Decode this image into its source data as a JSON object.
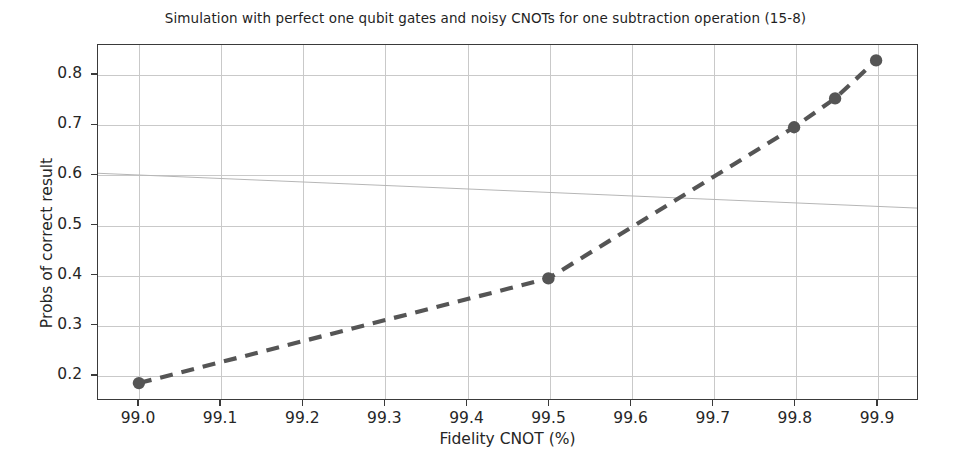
{
  "chart_data": {
    "type": "line",
    "title": "Simulation with perfect one qubit gates and noisy CNOTs for one subtraction operation (15-8)",
    "xlabel": "Fidelity CNOT (%)",
    "ylabel": "Probs of correct result",
    "x": [
      99.0,
      99.5,
      99.8,
      99.85,
      99.9
    ],
    "values": [
      0.182,
      0.392,
      0.695,
      0.753,
      0.829
    ],
    "series": [
      {
        "name": "Probs of correct result",
        "x": [
          99.0,
          99.5,
          99.8,
          99.85,
          99.9
        ],
        "values": [
          0.182,
          0.392,
          0.695,
          0.753,
          0.829
        ]
      }
    ],
    "xlim": [
      98.95,
      99.95
    ],
    "ylim": [
      0.15,
      0.86
    ],
    "xticks": [
      99.0,
      99.1,
      99.2,
      99.3,
      99.4,
      99.5,
      99.6,
      99.7,
      99.8,
      99.9
    ],
    "xtick_labels": [
      "99.0",
      "99.1",
      "99.2",
      "99.3",
      "99.4",
      "99.5",
      "99.6",
      "99.7",
      "99.8",
      "99.9"
    ],
    "yticks": [
      0.2,
      0.3,
      0.4,
      0.5,
      0.6,
      0.7,
      0.8
    ],
    "ytick_labels": [
      "0.2",
      "0.3",
      "0.4",
      "0.5",
      "0.6",
      "0.7",
      "0.8"
    ],
    "grid": true,
    "legend": null,
    "line_style": "dashed",
    "marker": "circle",
    "colors": {
      "line": "#555555",
      "marker": "#555555",
      "grid": "#c9c9c9",
      "axis": "#3a3a3a",
      "background": "#ffffff",
      "text": "#262626"
    },
    "annotations": [
      {
        "name": "scan-artifact-line",
        "description": "faint diagonal scanner artifact crossing the plot near 0.60"
      }
    ]
  }
}
